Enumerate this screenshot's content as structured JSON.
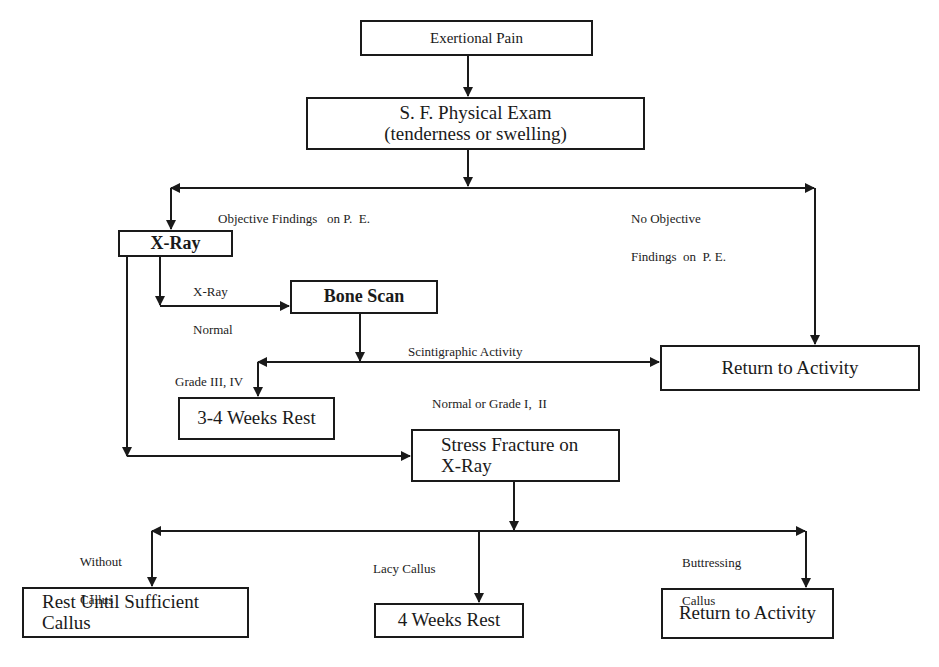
{
  "diagram": {
    "line_color": "#1a1a1a",
    "nodes": {
      "exertional_pain": "Exertional Pain",
      "physical_exam_line1": "S. F. Physical Exam",
      "physical_exam_line2": "(tenderness or swelling)",
      "xray": "X-Ray",
      "bone_scan": "Bone Scan",
      "return_activity_1": "Return to Activity",
      "weeks_rest_3_4": "3-4 Weeks Rest",
      "stress_fracture_line1": "Stress Fracture on",
      "stress_fracture_line2": "X-Ray",
      "rest_until_line1": "Rest Until Sufficient",
      "rest_until_line2": "Callus",
      "weeks_rest_4": "4 Weeks Rest",
      "return_activity_2": "Return to Activity"
    },
    "edge_labels": {
      "objective_findings": "Objective Findings   on P.  E.",
      "no_objective_line1": "No Objective",
      "no_objective_line2": "Findings  on  P. E.",
      "xray_normal_line1": "X-Ray",
      "xray_normal_line2": "Normal",
      "scintigraphic": "Scintigraphic Activity",
      "grade_3_4": "Grade III, IV",
      "normal_grade_1_2": "Normal or Grade I,  II",
      "without_callus_line1": "Without",
      "without_callus_line2": "Callus",
      "lacy_callus": "Lacy Callus",
      "buttressing_line1": "Buttressing",
      "buttressing_line2": "Callus"
    }
  }
}
